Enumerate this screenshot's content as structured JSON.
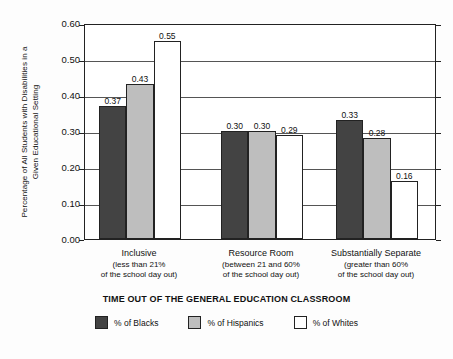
{
  "chart_data": {
    "type": "bar",
    "title": "",
    "xlabel": "TIME OUT OF THE GENERAL EDUCATION CLASSROOM",
    "ylabel": "Percentage of All Students with Disabilities in a Given Educational Setting",
    "ylabel_line1": "Percentage of All Students with Disabilities in a",
    "ylabel_line2": "Given Educational Setting",
    "ylim": [
      0.0,
      0.6
    ],
    "ytick_step": 0.1,
    "ytick_labels": [
      "0.00",
      "0.10",
      "0.20",
      "0.30",
      "0.40",
      "0.50",
      "0.60"
    ],
    "ytick_values": [
      0.0,
      0.1,
      0.2,
      0.3,
      0.4,
      0.5,
      0.6
    ],
    "grid": true,
    "legend_position": "bottom",
    "categories": [
      "Inclusive",
      "Resource Room",
      "Substantially Separate"
    ],
    "category_sublabels": [
      [
        "(less than 21%",
        "of the school day out)"
      ],
      [
        "(between 21 and 60%",
        "of the school day out)"
      ],
      [
        "(greater than 60%",
        "of the school day out)"
      ]
    ],
    "series": [
      {
        "name": "% of Blacks",
        "color": "#434343",
        "values": [
          0.37,
          0.3,
          0.33
        ],
        "labels": [
          "0.37",
          "0.30",
          "0.33"
        ]
      },
      {
        "name": "% of Hispanics",
        "color": "#bebebe",
        "values": [
          0.43,
          0.3,
          0.28
        ],
        "labels": [
          "0.43",
          "0.30",
          "0.28"
        ]
      },
      {
        "name": "% of Whites",
        "color": "#ffffff",
        "values": [
          0.55,
          0.29,
          0.16
        ],
        "labels": [
          "0.55",
          "0.29",
          "0.16"
        ]
      }
    ]
  },
  "colors": {
    "blacks": "#434343",
    "hispanics": "#bebebe",
    "whites": "#ffffff",
    "axis": "#222222",
    "grid": "#555555",
    "background": "#fdfdfd"
  }
}
